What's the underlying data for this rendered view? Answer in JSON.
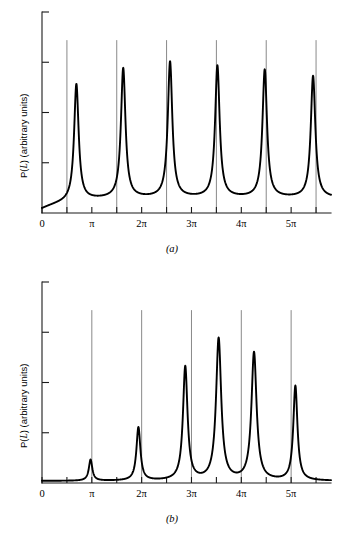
{
  "figure": {
    "type": "line-plot-pair",
    "background_color": "#ffffff",
    "curve_color": "#000000",
    "axis_color": "#1a1a1a",
    "gridline_color": "#6b6b6b"
  },
  "chart_data": [
    {
      "id": "a",
      "type": "line",
      "caption": "(a)",
      "title": "",
      "xlabel": "kL",
      "ylabel": "P(L) (arbitrary units)",
      "xlabel_parts": {
        "italic_k": "k",
        "italic_L": "L"
      },
      "ylabel_parts": {
        "p_of": "P(",
        "italic_L": "L",
        "close": ")",
        "units": " (arbitrary units)"
      },
      "x_unit": "pi",
      "xlim": [
        0,
        5.8
      ],
      "ylim": [
        0,
        1.0
      ],
      "grid": true,
      "grid_axis": "x",
      "legend": false,
      "x_tick_labels": [
        "0",
        "π",
        "2π",
        "3π",
        "4π",
        "5π"
      ],
      "x_tick_values": [
        0,
        1,
        2,
        3,
        4,
        5
      ],
      "x_minor_tick_values": [
        0.5,
        1.5,
        2.5,
        3.5,
        4.5,
        5.5
      ],
      "y_tick_values": [
        0.25,
        0.5,
        0.75,
        1.0
      ],
      "y_tick_labels": [
        "",
        "",
        "",
        ""
      ],
      "gridline_x_values": [
        0.5,
        1.5,
        2.5,
        3.5,
        4.5,
        5.5
      ],
      "gridline_top_y": 0.86,
      "baseline_y": 0.02,
      "background_rise": {
        "amplitude": 0.055,
        "width": 0.55
      },
      "peaks": [
        {
          "center": 0.69,
          "height": 0.6,
          "width": 0.055
        },
        {
          "center": 1.63,
          "height": 0.665,
          "width": 0.055
        },
        {
          "center": 2.57,
          "height": 0.695,
          "width": 0.055
        },
        {
          "center": 3.52,
          "height": 0.675,
          "width": 0.055
        },
        {
          "center": 4.47,
          "height": 0.655,
          "width": 0.055
        },
        {
          "center": 5.44,
          "height": 0.625,
          "width": 0.055
        }
      ]
    },
    {
      "id": "b",
      "type": "line",
      "caption": "(b)",
      "title": "",
      "xlabel": "kL",
      "ylabel": "P(L) (arbitrary units)",
      "xlabel_parts": {
        "italic_k": "k",
        "italic_L": "L"
      },
      "ylabel_parts": {
        "p_of": "P(",
        "italic_L": "L",
        "close": ")",
        "units": " (arbitrary units)"
      },
      "x_unit": "pi",
      "xlim": [
        0,
        5.8
      ],
      "ylim": [
        0,
        1.0
      ],
      "grid": true,
      "grid_axis": "x",
      "legend": false,
      "x_tick_labels": [
        "0",
        "π",
        "2π",
        "3π",
        "4π",
        "5π"
      ],
      "x_tick_values": [
        0,
        1,
        2,
        3,
        4,
        5
      ],
      "x_minor_tick_values": [
        0.5,
        1.5,
        2.5,
        3.5,
        4.5,
        5.5
      ],
      "y_tick_values": [
        0.25,
        0.5,
        0.75,
        1.0
      ],
      "y_tick_labels": [
        "",
        "",
        "",
        ""
      ],
      "gridline_x_values": [
        1,
        2,
        3,
        4,
        5
      ],
      "gridline_top_y": 0.86,
      "baseline_y": 0.01,
      "background_rise": {
        "amplitude": 0.0,
        "width": 0.5
      },
      "peaks": [
        {
          "center": 0.975,
          "height": 0.115,
          "width": 0.042
        },
        {
          "center": 1.935,
          "height": 0.275,
          "width": 0.048
        },
        {
          "center": 2.875,
          "height": 0.575,
          "width": 0.055
        },
        {
          "center": 3.545,
          "height": 0.715,
          "width": 0.062
        },
        {
          "center": 4.255,
          "height": 0.645,
          "width": 0.062
        },
        {
          "center": 5.085,
          "height": 0.48,
          "width": 0.05
        }
      ]
    }
  ]
}
